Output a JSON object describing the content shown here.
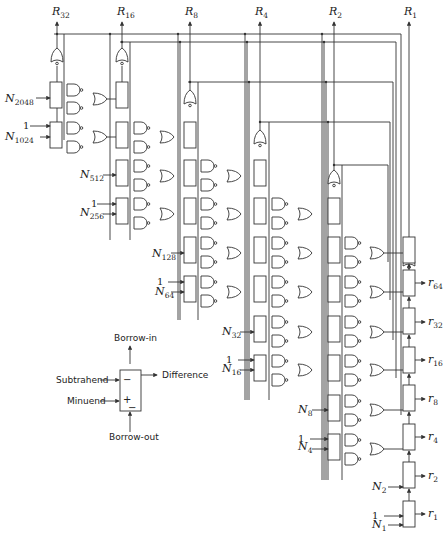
{
  "outputs_top": [
    {
      "id": "R32",
      "letter": "R",
      "sub": "32",
      "x": 57
    },
    {
      "id": "R16",
      "letter": "R",
      "sub": "16",
      "x": 122
    },
    {
      "id": "R8",
      "letter": "R",
      "sub": "8",
      "x": 190
    },
    {
      "id": "R4",
      "letter": "R",
      "sub": "4",
      "x": 260
    },
    {
      "id": "R2",
      "letter": "R",
      "sub": "2",
      "x": 334
    },
    {
      "id": "R1",
      "letter": "R",
      "sub": "1",
      "x": 409
    }
  ],
  "inputs": [
    {
      "id": "N2048",
      "letter": "N",
      "sub": "2048",
      "x": 5,
      "y": 102
    },
    {
      "id": "N1024",
      "letter": "N",
      "sub": "1024",
      "x": 5,
      "y": 140
    },
    {
      "id": "N512",
      "letter": "N",
      "sub": "512",
      "x": 80,
      "y": 178
    },
    {
      "id": "N256",
      "letter": "N",
      "sub": "256",
      "x": 80,
      "y": 216
    },
    {
      "id": "N128",
      "letter": "N",
      "sub": "128",
      "x": 152,
      "y": 257
    },
    {
      "id": "N64",
      "letter": "N",
      "sub": "64",
      "x": 155,
      "y": 295
    },
    {
      "id": "N32",
      "letter": "N",
      "sub": "32",
      "x": 222,
      "y": 335
    },
    {
      "id": "N16",
      "letter": "N",
      "sub": "16",
      "x": 222,
      "y": 372
    },
    {
      "id": "N8",
      "letter": "N",
      "sub": "8",
      "x": 298,
      "y": 413
    },
    {
      "id": "N4",
      "letter": "N",
      "sub": "4",
      "x": 298,
      "y": 450
    },
    {
      "id": "N2",
      "letter": "N",
      "sub": "2",
      "x": 372,
      "y": 490
    },
    {
      "id": "N1",
      "letter": "N",
      "sub": "1",
      "x": 372,
      "y": 528
    }
  ],
  "constant_one": "1",
  "outputs_right": [
    {
      "id": "r64",
      "letter": "r",
      "sub": "64",
      "y": 283
    },
    {
      "id": "r32",
      "letter": "r",
      "sub": "32",
      "y": 322
    },
    {
      "id": "r16",
      "letter": "r",
      "sub": "16",
      "y": 360
    },
    {
      "id": "r8",
      "letter": "r",
      "sub": "8",
      "y": 399
    },
    {
      "id": "r4",
      "letter": "r",
      "sub": "4",
      "y": 437
    },
    {
      "id": "r2",
      "letter": "r",
      "sub": "2",
      "y": 476
    },
    {
      "id": "r1",
      "letter": "r",
      "sub": "1",
      "y": 514
    }
  ],
  "legend": {
    "borrow_in": "Borrow-in",
    "subtrahend": "Subtrahend",
    "minuend": "Minuend",
    "difference": "Difference",
    "borrow_out": "Borrow-out",
    "sign_minus_top": "−",
    "sign_plus": "+",
    "sign_minus_bottom": "−"
  }
}
